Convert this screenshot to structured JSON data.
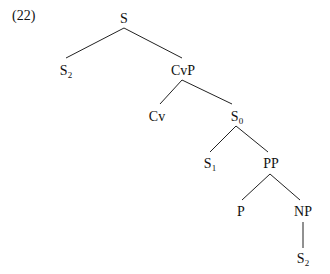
{
  "example_number": "(22)",
  "tree": {
    "nodes": [
      {
        "id": "S",
        "label": "S",
        "sub": ""
      },
      {
        "id": "S2a",
        "label": "S",
        "sub": "2"
      },
      {
        "id": "CvP",
        "label": "CvP",
        "sub": ""
      },
      {
        "id": "Cv",
        "label": "Cv",
        "sub": ""
      },
      {
        "id": "S0",
        "label": "S",
        "sub": "0"
      },
      {
        "id": "S1",
        "label": "S",
        "sub": "1"
      },
      {
        "id": "PP",
        "label": "PP",
        "sub": ""
      },
      {
        "id": "P",
        "label": "P",
        "sub": ""
      },
      {
        "id": "NP",
        "label": "NP",
        "sub": ""
      },
      {
        "id": "S2b",
        "label": "S",
        "sub": "2"
      }
    ],
    "edges": [
      [
        "S",
        "S2a"
      ],
      [
        "S",
        "CvP"
      ],
      [
        "CvP",
        "Cv"
      ],
      [
        "CvP",
        "S0"
      ],
      [
        "S0",
        "S1"
      ],
      [
        "S0",
        "PP"
      ],
      [
        "PP",
        "P"
      ],
      [
        "PP",
        "NP"
      ],
      [
        "NP",
        "S2b"
      ]
    ]
  }
}
